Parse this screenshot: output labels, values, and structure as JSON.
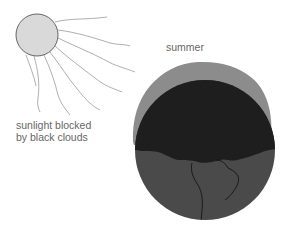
{
  "diagram": {
    "labels": {
      "season": "summer",
      "blocked_line1": "sunlight blocked",
      "blocked_line2": "by black clouds"
    },
    "elements": {
      "sun": "sun-icon",
      "rays": "sunlight-rays",
      "earth": "earth-globe",
      "clouds": "black-cloud-cover",
      "atmosphere": "gray-atmosphere-halo",
      "continent": "continent-outline"
    },
    "colors": {
      "sun_fill": "#d9d9d9",
      "sun_stroke": "#666666",
      "ray_stroke": "#9a9a9a",
      "halo": "#8c8c8c",
      "clouds": "#1e1e1e",
      "earth_surface": "#4a4a4a",
      "continent_line": "#151515",
      "text": "#666666"
    }
  }
}
